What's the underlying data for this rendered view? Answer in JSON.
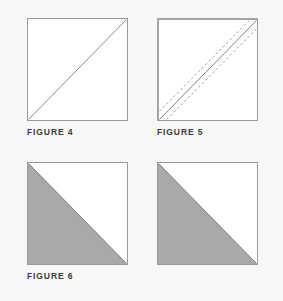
{
  "page": {
    "background_color": "#f7f7f6",
    "width": 283,
    "height": 301
  },
  "palette": {
    "square_outline": "#9a9a9a",
    "square_fill": "#ffffff",
    "triangle_fill": "#a9a9a9",
    "diagonal_line": "#8d8d8d",
    "dashed_line": "#a0a0a0",
    "emphasis_edge": "#a4a4a4",
    "caption_text": "#3b3b3b"
  },
  "figures": [
    {
      "id": "figure-4",
      "caption": "FIGURE 4",
      "has_caption": true,
      "column": 1,
      "row": 1,
      "fill": "none",
      "diagonal": "bottom-left-to-top-right",
      "dashed_guides": 0,
      "edge_emphasis": false,
      "description": "Open square with a single diagonal drawn from the lower-left corner to the upper-right corner."
    },
    {
      "id": "figure-5",
      "caption": "FIGURE 5",
      "has_caption": true,
      "column": 2,
      "row": 1,
      "fill": "none",
      "diagonal": "bottom-left-to-top-right",
      "dashed_guides": 2,
      "edge_emphasis": true,
      "description": "Square with the drawn diagonal plus two dashed stitching guide lines running parallel on either side of it."
    },
    {
      "id": "figure-6",
      "caption": "FIGURE 6",
      "has_caption": true,
      "column": 1,
      "row": 2,
      "fill": "lower-left-triangle",
      "diagonal": "top-left-to-bottom-right",
      "dashed_guides": 0,
      "edge_emphasis": false,
      "description": "Square with the lower-left half shaded solid grey, divided by a diagonal from the upper-left corner to the lower-right corner."
    },
    {
      "id": "figure-unlabeled",
      "caption": "",
      "has_caption": false,
      "column": 2,
      "row": 2,
      "fill": "lower-left-triangle",
      "diagonal": "top-left-to-bottom-right",
      "dashed_guides": 0,
      "edge_emphasis": false,
      "description": "Second shaded square matching Figure 6, shown without a caption."
    }
  ]
}
